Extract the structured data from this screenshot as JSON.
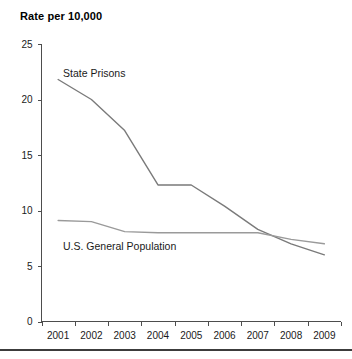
{
  "chart_data": {
    "type": "line",
    "title": "Rate per 10,000",
    "xlabel": "",
    "ylabel": "Rate per 10,000",
    "ylim": [
      0,
      25
    ],
    "yticks": [
      0,
      5,
      10,
      15,
      20,
      25
    ],
    "grid": false,
    "legend_position": "inline-annotation",
    "categories": [
      "2001",
      "2002",
      "2003",
      "2004",
      "2005",
      "2006",
      "2007",
      "2008",
      "2009"
    ],
    "series": [
      {
        "name": "State Prisons",
        "color": "#7a7a7a",
        "values": [
          21.8,
          20.0,
          17.2,
          12.3,
          12.3,
          10.4,
          8.3,
          7.0,
          6.0
        ]
      },
      {
        "name": "U.S. General Population",
        "color": "#9a9a9a",
        "values": [
          9.1,
          9.0,
          8.1,
          8.0,
          8.0,
          8.0,
          8.0,
          7.4,
          7.0
        ]
      }
    ],
    "annotations": [
      {
        "text": "State Prisons",
        "x_px": 63,
        "y_px": 77
      },
      {
        "text": "U.S. General Population",
        "x_px": 63,
        "y_px": 250
      }
    ]
  },
  "axes": {
    "y_tick_labels": [
      "25",
      "20",
      "15",
      "10",
      "5",
      "0"
    ],
    "x_tick_labels": [
      "2001",
      "2002",
      "2003",
      "2004",
      "2005",
      "2006",
      "2007",
      "2008",
      "2009"
    ]
  },
  "colors": {
    "axis": "#4d4d4d",
    "text": "#1a1a1a",
    "rule": "#3c3c3c",
    "series_primary": "#7a7a7a",
    "series_secondary": "#9a9a9a",
    "background": "#ffffff"
  }
}
